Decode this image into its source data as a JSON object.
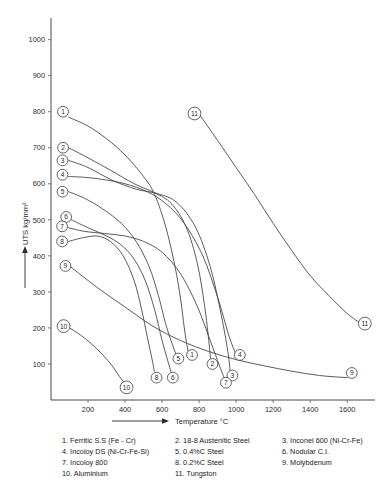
{
  "chart_data": {
    "type": "line",
    "title": "",
    "xlabel": "Temperature °C",
    "ylabel": "UTS kg/mm²",
    "xlim": [
      0,
      1750
    ],
    "ylim": [
      0,
      1060
    ],
    "xticks": [
      200,
      400,
      600,
      800,
      1000,
      1200,
      1400,
      1600
    ],
    "yticks": [
      100,
      200,
      300,
      400,
      500,
      600,
      700,
      800,
      900,
      1000
    ],
    "grid": false,
    "legend_position": "below-plot",
    "series": [
      {
        "id": "1",
        "name": "Ferritic S.S (Fe - Cr)",
        "start_label": "1",
        "end_label": "1",
        "points": [
          [
            95,
            785
          ],
          [
            200,
            760
          ],
          [
            300,
            725
          ],
          [
            400,
            680
          ],
          [
            500,
            620
          ],
          [
            560,
            570
          ],
          [
            620,
            480
          ],
          [
            670,
            370
          ],
          [
            700,
            280
          ],
          [
            720,
            200
          ],
          [
            735,
            150
          ],
          [
            745,
            125
          ]
        ]
      },
      {
        "id": "2",
        "name": "18-8 Austenitic Steel",
        "start_label": "2",
        "end_label": "2",
        "points": [
          [
            95,
            700
          ],
          [
            200,
            672
          ],
          [
            320,
            638
          ],
          [
            450,
            600
          ],
          [
            560,
            575
          ],
          [
            650,
            545
          ],
          [
            730,
            480
          ],
          [
            790,
            380
          ],
          [
            830,
            260
          ],
          [
            852,
            165
          ],
          [
            862,
            112
          ]
        ]
      },
      {
        "id": "3",
        "name": "Inconel 600 (Ni-Cr-Fe)",
        "start_label": "3",
        "end_label": "3",
        "points": [
          [
            95,
            665
          ],
          [
            200,
            645
          ],
          [
            330,
            610
          ],
          [
            460,
            585
          ],
          [
            580,
            572
          ],
          [
            680,
            548
          ],
          [
            780,
            480
          ],
          [
            860,
            370
          ],
          [
            920,
            235
          ],
          [
            955,
            135
          ],
          [
            968,
            78
          ]
        ]
      },
      {
        "id": "4",
        "name": "Incoloy DS (Ni-Cr-Fe-Si)",
        "start_label": "4",
        "end_label": "4",
        "points": [
          [
            95,
            620
          ],
          [
            180,
            618
          ],
          [
            280,
            612
          ],
          [
            400,
            600
          ],
          [
            520,
            578
          ],
          [
            620,
            545
          ],
          [
            720,
            490
          ],
          [
            820,
            400
          ],
          [
            900,
            285
          ],
          [
            960,
            180
          ],
          [
            1000,
            125
          ]
        ]
      },
      {
        "id": "5",
        "name": "0.4%C Steel",
        "start_label": "5",
        "end_label": "5",
        "points": [
          [
            95,
            578
          ],
          [
            180,
            560
          ],
          [
            280,
            530
          ],
          [
            380,
            490
          ],
          [
            460,
            440
          ],
          [
            530,
            370
          ],
          [
            580,
            290
          ],
          [
            620,
            210
          ],
          [
            655,
            155
          ],
          [
            680,
            120
          ]
        ]
      },
      {
        "id": "6",
        "name": "Nodular C.I.",
        "start_label": "6",
        "end_label": "6",
        "points": [
          [
            110,
            500
          ],
          [
            200,
            478
          ],
          [
            300,
            455
          ],
          [
            380,
            430
          ],
          [
            450,
            390
          ],
          [
            510,
            330
          ],
          [
            560,
            250
          ],
          [
            600,
            165
          ],
          [
            630,
            110
          ],
          [
            648,
            78
          ]
        ]
      },
      {
        "id": "7",
        "name": "Incoloy 800",
        "start_label": "7",
        "end_label": "7",
        "points": [
          [
            95,
            478
          ],
          [
            180,
            468
          ],
          [
            290,
            462
          ],
          [
            400,
            455
          ],
          [
            500,
            440
          ],
          [
            600,
            410
          ],
          [
            700,
            350
          ],
          [
            790,
            260
          ],
          [
            860,
            165
          ],
          [
            910,
            95
          ],
          [
            940,
            55
          ]
        ]
      },
      {
        "id": "8",
        "name": "0.2%C Steel",
        "start_label": "8",
        "end_label": "8",
        "points": [
          [
            95,
            440
          ],
          [
            170,
            450
          ],
          [
            250,
            455
          ],
          [
            320,
            440
          ],
          [
            390,
            400
          ],
          [
            450,
            330
          ],
          [
            490,
            250
          ],
          [
            520,
            175
          ],
          [
            545,
            115
          ],
          [
            558,
            80
          ]
        ]
      },
      {
        "id": "9",
        "name": "Molybdenum",
        "start_label": "9",
        "end_label": "9",
        "points": [
          [
            105,
            370
          ],
          [
            250,
            312
          ],
          [
            400,
            258
          ],
          [
            550,
            205
          ],
          [
            700,
            165
          ],
          [
            850,
            135
          ],
          [
            1000,
            112
          ],
          [
            1150,
            95
          ],
          [
            1300,
            80
          ],
          [
            1450,
            68
          ],
          [
            1600,
            62
          ]
        ]
      },
      {
        "id": "10",
        "name": "Aluminium",
        "start_label": "10",
        "end_label": "10",
        "points": [
          [
            100,
            200
          ],
          [
            160,
            180
          ],
          [
            220,
            155
          ],
          [
            280,
            125
          ],
          [
            330,
            95
          ],
          [
            370,
            65
          ],
          [
            400,
            45
          ]
        ]
      },
      {
        "id": "11",
        "name": "Tungston",
        "start_label": "11",
        "end_label": "11",
        "points": [
          [
            805,
            790
          ],
          [
            900,
            720
          ],
          [
            1000,
            645
          ],
          [
            1100,
            570
          ],
          [
            1200,
            490
          ],
          [
            1300,
            415
          ],
          [
            1400,
            345
          ],
          [
            1500,
            290
          ],
          [
            1600,
            240
          ],
          [
            1680,
            210
          ]
        ]
      }
    ],
    "start_markers": [
      {
        "id": "1",
        "label": "1",
        "x": 65,
        "y": 800
      },
      {
        "id": "2",
        "label": "2",
        "x": 65,
        "y": 700
      },
      {
        "id": "3",
        "label": "3",
        "x": 62,
        "y": 665
      },
      {
        "id": "4",
        "label": "4",
        "x": 62,
        "y": 625
      },
      {
        "id": "5",
        "label": "5",
        "x": 62,
        "y": 578
      },
      {
        "id": "6",
        "label": "6",
        "x": 82,
        "y": 508
      },
      {
        "id": "7",
        "label": "7",
        "x": 60,
        "y": 482
      },
      {
        "id": "8",
        "label": "8",
        "x": 60,
        "y": 440
      },
      {
        "id": "9",
        "label": "9",
        "x": 78,
        "y": 372
      },
      {
        "id": "10",
        "label": "10",
        "x": 68,
        "y": 205
      },
      {
        "id": "11",
        "label": "11",
        "x": 775,
        "y": 795
      }
    ],
    "end_markers": [
      {
        "id": "1",
        "label": "1",
        "x": 762,
        "y": 125
      },
      {
        "id": "2",
        "label": "2",
        "x": 872,
        "y": 100
      },
      {
        "id": "3",
        "label": "3",
        "x": 980,
        "y": 68
      },
      {
        "id": "4",
        "label": "4",
        "x": 1020,
        "y": 125
      },
      {
        "id": "5",
        "label": "5",
        "x": 688,
        "y": 115
      },
      {
        "id": "6",
        "label": "6",
        "x": 658,
        "y": 62
      },
      {
        "id": "7",
        "label": "7",
        "x": 945,
        "y": 48
      },
      {
        "id": "8",
        "label": "8",
        "x": 570,
        "y": 62
      },
      {
        "id": "9",
        "label": "9",
        "x": 1625,
        "y": 75
      },
      {
        "id": "10",
        "label": "10",
        "x": 408,
        "y": 35
      },
      {
        "id": "11",
        "label": "11",
        "x": 1695,
        "y": 212
      }
    ]
  },
  "legend": {
    "entries": [
      "1. Ferritic S.S (Fe - Cr)",
      "2. 18-8 Austenitic Steel",
      "3. Inconel 600 (Ni-Cr-Fe)",
      "4. Incoloy DS (Ni-Cr-Fe-Si)",
      "5. 0.4%C Steel",
      "6. Nodular C.I.",
      "7. Incoloy 800",
      "8. 0.2%C Steel",
      "9. Molybdenum",
      "10. Aluminium",
      "11. Tungston",
      ""
    ]
  },
  "colors": {
    "background": "#ffffff",
    "curve": "#3d3d3d",
    "axis": "#4a4a4a",
    "text": "#1a1a1a"
  }
}
